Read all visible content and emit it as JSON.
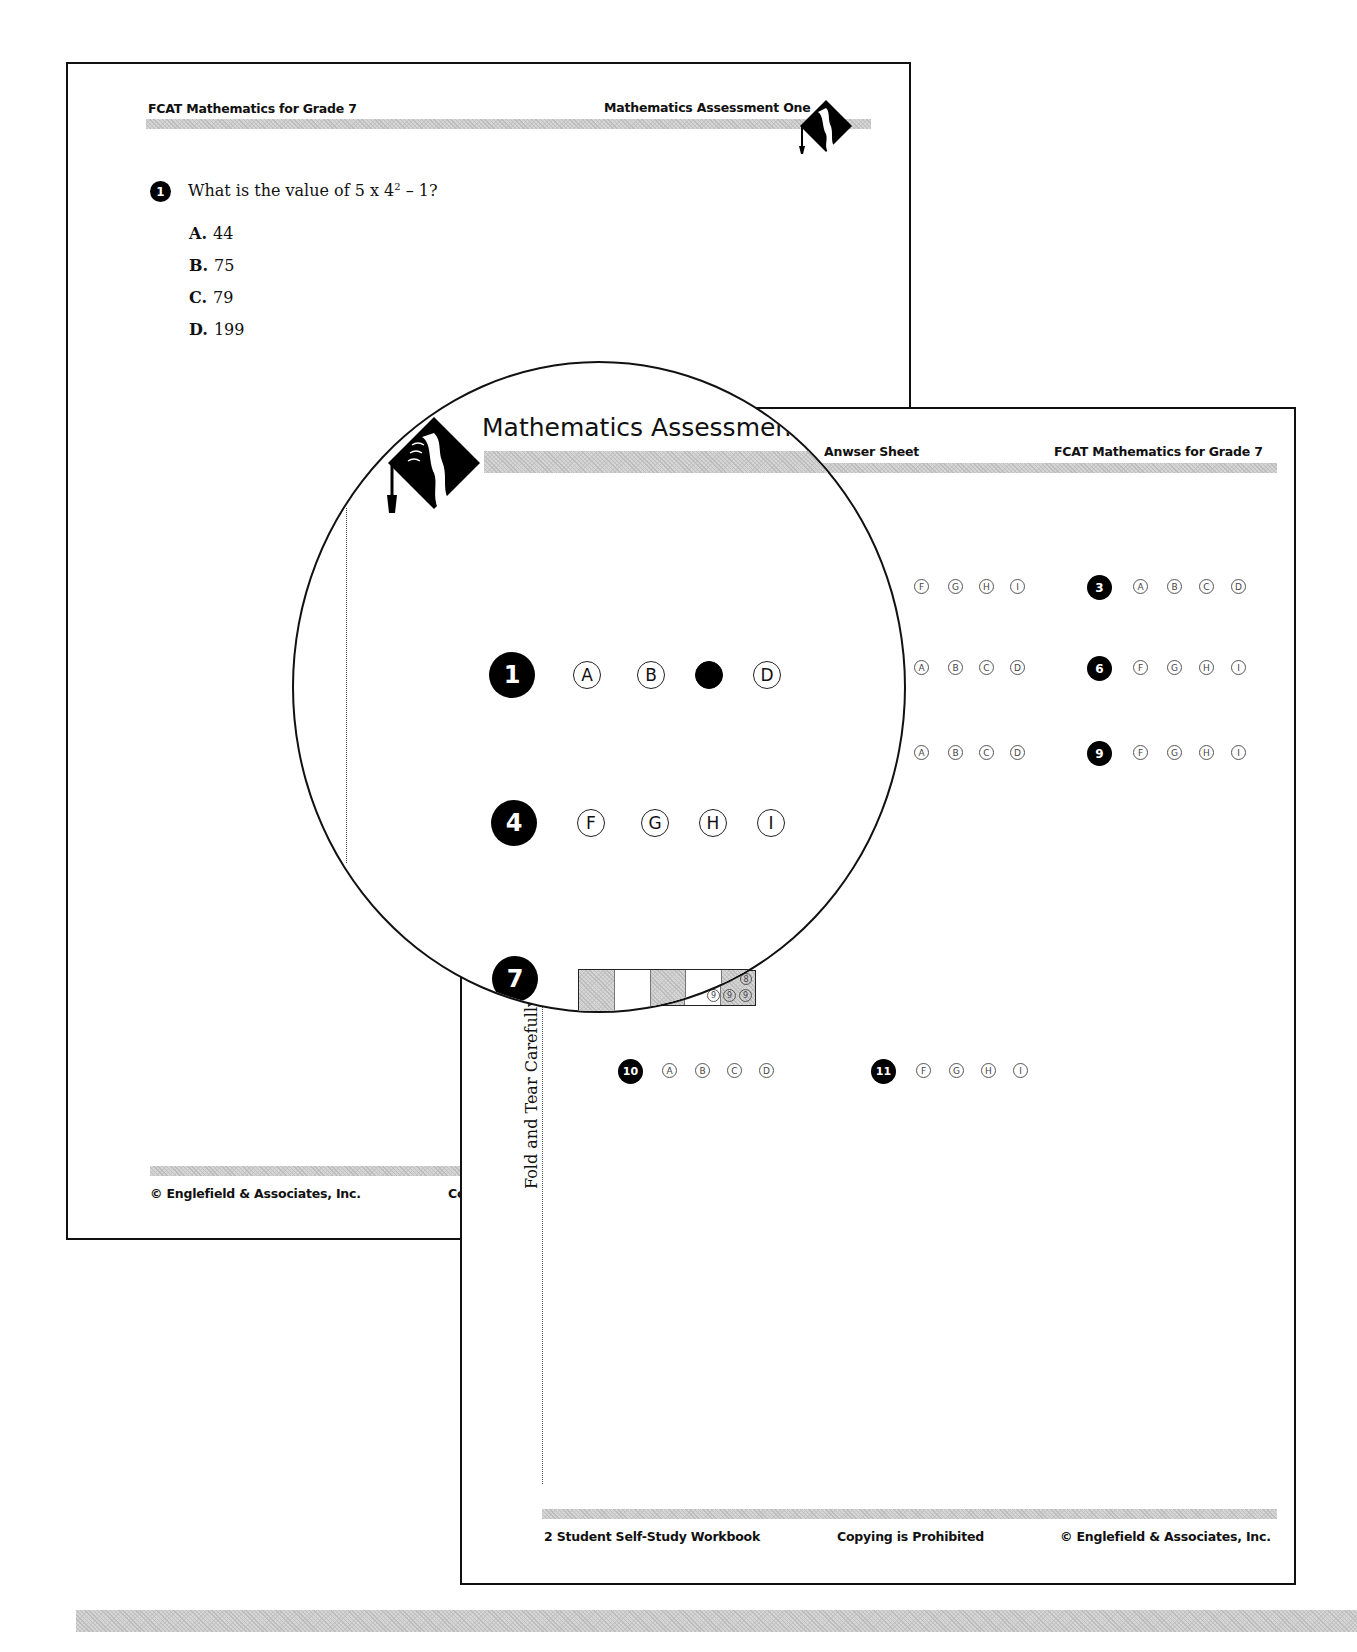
{
  "back_page": {
    "header": {
      "left": "FCAT Mathematics for Grade 7",
      "right": "Mathematics Assessment One"
    },
    "question": {
      "number": "1",
      "prompt_prefix": "What is the value of 5 x 4",
      "prompt_exponent": "2",
      "prompt_suffix": " – 1?",
      "choices": [
        {
          "letter": "A.",
          "value": "44"
        },
        {
          "letter": "B.",
          "value": "75"
        },
        {
          "letter": "C.",
          "value": "79"
        },
        {
          "letter": "D.",
          "value": "199"
        }
      ]
    },
    "footer": {
      "left": "© Englefield & Associates, Inc.",
      "clipped": "Co"
    }
  },
  "answer_sheet": {
    "header": {
      "left": "Anwser Sheet",
      "right": "FCAT Mathematics for Grade 7"
    },
    "fold_text": "Fold and Tear Carefully",
    "rows": [
      {
        "number": "2",
        "choices": [
          "F",
          "G",
          "H",
          "I"
        ]
      },
      {
        "number": "3",
        "choices": [
          "A",
          "B",
          "C",
          "D"
        ]
      },
      {
        "number": "5",
        "choices": [
          "A",
          "B",
          "C",
          "D"
        ]
      },
      {
        "number": "6",
        "choices": [
          "F",
          "G",
          "H",
          "I"
        ]
      },
      {
        "number": "8",
        "choices": [
          "A",
          "B",
          "C",
          "D"
        ]
      },
      {
        "number": "9",
        "choices": [
          "F",
          "G",
          "H",
          "I"
        ]
      },
      {
        "number": "10",
        "choices": [
          "A",
          "B",
          "C",
          "D"
        ]
      },
      {
        "number": "11",
        "choices": [
          "F",
          "G",
          "H",
          "I"
        ]
      }
    ],
    "grid_digits": [
      "8",
      "9",
      "9",
      "9"
    ],
    "footer": {
      "left": "2  Student Self-Study Workbook",
      "center": "Copying is Prohibited",
      "right": "© Englefield & Associates, Inc."
    }
  },
  "magnifier": {
    "title": "Mathematics Assessment",
    "q1": {
      "number": "1",
      "choices": [
        "A",
        "B",
        "C",
        "D"
      ],
      "selected": "C"
    },
    "q4": {
      "number": "4",
      "choices": [
        "F",
        "G",
        "H",
        "I"
      ]
    },
    "q7": {
      "number": "7"
    }
  }
}
